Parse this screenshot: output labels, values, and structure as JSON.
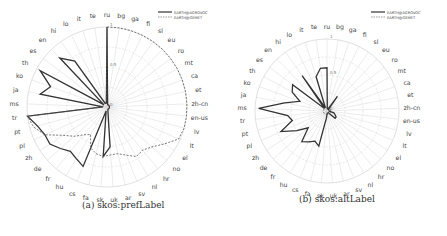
{
  "axes": [
    "ru",
    "bg",
    "ga",
    "fi",
    "sl",
    "eu",
    "ro",
    "mt",
    "ca",
    "et",
    "zh-cn",
    "en-us",
    "lv",
    "lt",
    "el",
    "no",
    "hr",
    "nl",
    "sv",
    "ar",
    "uk",
    "sk",
    "fa",
    "cs",
    "hu",
    "fr",
    "de",
    "zh",
    "pl",
    "pt",
    "tr",
    "ms",
    "ja",
    "ko",
    "th",
    "es",
    "en",
    "hi",
    "lo",
    "it",
    "te"
  ],
  "chart_data": [
    {
      "type": "radar",
      "title": "(a) skos:prefLabel",
      "radial_ticks": [
        "0",
        "0.5",
        "1"
      ],
      "rlim": [
        0,
        1
      ],
      "legend": {
        "position": "top-right",
        "entries": [
          "EARTH@AGROVOC",
          "EARTH@GEMET"
        ]
      },
      "categories": [
        "ru",
        "bg",
        "ga",
        "fi",
        "sl",
        "eu",
        "ro",
        "mt",
        "ca",
        "et",
        "zh-cn",
        "en-us",
        "lv",
        "lt",
        "el",
        "no",
        "hr",
        "nl",
        "sv",
        "ar",
        "uk",
        "sk",
        "fa",
        "cs",
        "hu",
        "fr",
        "de",
        "zh",
        "pl",
        "pt",
        "tr",
        "ms",
        "ja",
        "ko",
        "th",
        "es",
        "en",
        "hi",
        "lo",
        "it",
        "te"
      ],
      "series": [
        {
          "name": "EARTH@AGROVOC",
          "style": "solid",
          "values": [
            1.0,
            0.05,
            0.03,
            0.03,
            0.03,
            0.03,
            0.03,
            0.03,
            0.03,
            0.03,
            0.03,
            0.03,
            0.03,
            0.03,
            0.03,
            0.03,
            0.03,
            0.03,
            0.03,
            0.05,
            0.5,
            0.62,
            0.05,
            0.8,
            0.75,
            0.72,
            0.78,
            0.85,
            0.85,
            0.9,
            1.0,
            0.05,
            0.85,
            0.75,
            0.95,
            0.05,
            0.85,
            0.7,
            0.05,
            0.05,
            0.05
          ]
        },
        {
          "name": "EARTH@GEMET",
          "style": "dashed",
          "values": [
            1.0,
            1.0,
            1.0,
            1.0,
            1.0,
            1.0,
            1.0,
            1.0,
            1.0,
            1.0,
            1.0,
            1.0,
            1.0,
            0.98,
            0.85,
            0.75,
            0.7,
            0.72,
            0.65,
            0.6,
            0.6,
            0.62,
            0.6,
            0.55,
            0.4,
            0.45,
            0.55,
            0.65,
            0.85,
            0.95,
            1.0,
            0.05,
            0.05,
            0.05,
            0.05,
            0.05,
            0.05,
            0.05,
            0.05,
            0.05,
            0.05
          ]
        }
      ]
    },
    {
      "type": "radar",
      "title": "(b) skos:altLabel",
      "radial_ticks": [
        "0",
        "0.5",
        "1"
      ],
      "rlim": [
        0,
        1
      ],
      "legend": {
        "position": "top-right",
        "entries": [
          "EARTH@AGROVOC",
          "EARTH@GEMET"
        ]
      },
      "categories": [
        "ru",
        "bg",
        "ga",
        "fi",
        "sl",
        "eu",
        "ro",
        "mt",
        "ca",
        "et",
        "zh-cn",
        "en-us",
        "lv",
        "lt",
        "el",
        "no",
        "hr",
        "nl",
        "sv",
        "ar",
        "uk",
        "sk",
        "fa",
        "cs",
        "hu",
        "fr",
        "de",
        "zh",
        "pl",
        "pt",
        "tr",
        "ms",
        "ja",
        "ko",
        "th",
        "es",
        "en",
        "hi",
        "lo",
        "it",
        "te"
      ],
      "series": [
        {
          "name": "EARTH@AGROVOC",
          "style": "solid",
          "values": [
            0.6,
            0.03,
            0.03,
            0.03,
            0.25,
            0.03,
            0.03,
            0.03,
            0.03,
            0.03,
            0.03,
            0.03,
            0.1,
            0.12,
            0.15,
            0.15,
            0.03,
            0.03,
            0.03,
            0.03,
            0.03,
            0.1,
            0.5,
            0.45,
            0.5,
            0.55,
            0.35,
            0.5,
            0.7,
            0.5,
            0.55,
            0.95,
            0.6,
            0.4,
            0.55,
            0.6,
            0.05,
            0.6,
            0.05,
            0.5,
            0.6
          ]
        },
        {
          "name": "EARTH@GEMET",
          "style": "dashed",
          "values": [
            0.05,
            0.05,
            0.05,
            0.05,
            0.05,
            0.05,
            0.05,
            0.05,
            0.05,
            0.05,
            0.05,
            0.05,
            0.05,
            0.05,
            0.05,
            0.05,
            0.05,
            0.05,
            0.05,
            0.05,
            0.05,
            0.05,
            0.05,
            0.05,
            0.05,
            0.05,
            0.05,
            0.05,
            0.05,
            0.05,
            0.05,
            0.05,
            0.05,
            0.05,
            0.05,
            0.05,
            0.05,
            0.05,
            0.05,
            0.05,
            0.05
          ]
        }
      ]
    }
  ],
  "layout": [
    {
      "cx": 107,
      "cy": 107,
      "r": 80,
      "left": 0,
      "legendX": 158,
      "legendY": 12,
      "captionX": 82,
      "captionY": 207
    },
    {
      "cx": 104,
      "cy": 111,
      "r": 72,
      "left": 223,
      "legendX": 148,
      "legendY": 12,
      "captionX": 76,
      "captionY": 201
    }
  ],
  "colors": {
    "solid": "#333333",
    "dashed": "#555555",
    "grid": "#d8d8d8",
    "label": "#444444"
  }
}
